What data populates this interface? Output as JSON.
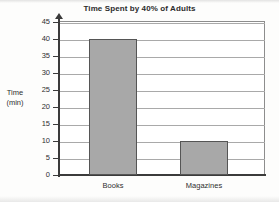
{
  "chart_data": {
    "type": "bar",
    "title": "Time Spent by 40% of Adults",
    "categories": [
      "Books",
      "Magazines"
    ],
    "values": [
      40,
      10
    ],
    "xlabel": "",
    "ylabel": "Time (min)",
    "ylabel_line1": "Time",
    "ylabel_line2": "(min)",
    "ylim": [
      0,
      45
    ],
    "ytick_step": 5,
    "yticks": [
      0,
      5,
      10,
      15,
      20,
      25,
      30,
      35,
      40,
      45
    ],
    "ytick_labels": [
      "0",
      "5",
      "10",
      "15",
      "20",
      "25",
      "30",
      "35",
      "40",
      "45"
    ],
    "grid": true,
    "grid_axis": "y",
    "legend": false,
    "legend_position": "none",
    "bar_fill_color": "#a8a8a8",
    "bar_border_color": "#555555",
    "gridline_color": "#a9a9a9",
    "axis_color": "#3b3b3b",
    "background_color": "#ffffff",
    "axis_arrow_top": true,
    "series": [
      {
        "name": "Time (min)",
        "values": [
          40,
          10
        ]
      }
    ],
    "points": [
      {
        "category": "Books",
        "value": 40
      },
      {
        "category": "Magazines",
        "value": 10
      }
    ]
  }
}
